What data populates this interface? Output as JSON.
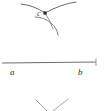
{
  "figure": {
    "kind": "compass-and-straightedge-construction",
    "background_color": "#ffffff",
    "stroke_color": "#555555",
    "line_color": "#6b6b6b",
    "label_color": "#2b2b2b",
    "width": 105,
    "height": 111
  },
  "labels": {
    "point_c": "c",
    "point_a": "a",
    "point_b": "b"
  },
  "elements": {
    "arc_upper_left_name": "arc-from-a",
    "arc_upper_right_name": "arc-from-b",
    "arc_lower_name": "arc-lower",
    "intersection_point_name": "intersection-point-c",
    "baseline_name": "segment-ab",
    "right_tick_name": "endpoint-tick-b",
    "v_lines_name": "partial-lines-below"
  },
  "geometry": {
    "point_c": {
      "x": 45,
      "y": 13
    },
    "baseline": {
      "x1": 2,
      "y1": 63,
      "x2": 96,
      "y2": 62
    },
    "tick_b": {
      "x": 96,
      "y_top": 59,
      "y_bottom": 66
    },
    "label_a_pos": {
      "x": 10,
      "y": 73
    },
    "label_b_pos": {
      "x": 80,
      "y": 73
    }
  }
}
